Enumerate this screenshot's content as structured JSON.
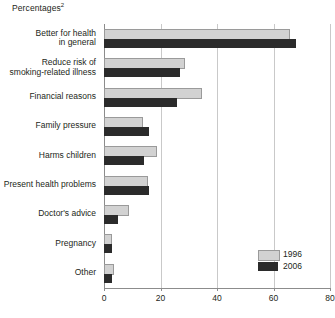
{
  "chart_data": {
    "type": "bar",
    "orientation": "horizontal",
    "title": "Percentages",
    "title_superscript": "2",
    "xlabel": "",
    "ylabel": "",
    "xlim": [
      0,
      80
    ],
    "xticks": [
      0,
      20,
      40,
      60,
      80
    ],
    "grid": true,
    "legend_position": "bottom-right",
    "categories": [
      "Better for health in general",
      "Reduce risk of smoking-related illness",
      "Financial reasons",
      "Family pressure",
      "Harms children",
      "Present health problems",
      "Doctor's advice",
      "Pregnancy",
      "Other"
    ],
    "category_lines": [
      [
        "Better for health",
        "in general"
      ],
      [
        "Reduce risk of",
        "smoking-related illness"
      ],
      [
        "Financial reasons"
      ],
      [
        "Family pressure"
      ],
      [
        "Harms children"
      ],
      [
        "Present health problems"
      ],
      [
        "Doctor's advice"
      ],
      [
        "Pregnancy"
      ],
      [
        "Other"
      ]
    ],
    "series": [
      {
        "name": "1996",
        "color": "#d2d2d2",
        "values": [
          65,
          28,
          34,
          13,
          18,
          15,
          8,
          2,
          3
        ]
      },
      {
        "name": "2006",
        "color": "#2b2b2b",
        "values": [
          68,
          27,
          26,
          16,
          14,
          16,
          5,
          3,
          3
        ]
      }
    ]
  },
  "legend": {
    "items": [
      {
        "label": "1996",
        "color": "#d2d2d2"
      },
      {
        "label": "2006",
        "color": "#2b2b2b"
      }
    ]
  },
  "axis": {
    "tick_labels": [
      "0",
      "20",
      "40",
      "60",
      "80"
    ]
  },
  "colors": {
    "series_1996": "#d2d2d2",
    "series_2006": "#2b2b2b",
    "grid": "#c9c9c9",
    "axis": "#8c8c8c",
    "text": "#231f20",
    "background": "#ffffff"
  }
}
